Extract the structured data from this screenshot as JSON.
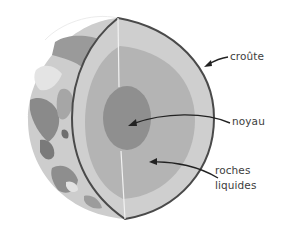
{
  "diagram": {
    "colors": {
      "background": "#ffffff",
      "surface_light": "#d8d8d8",
      "surface_dark": "#7e7e7e",
      "crust": "#cfcfcf",
      "mantle": "#b4b4b4",
      "core": "#8f8f8f",
      "outline": "#4a4a4a",
      "divider": "#f2f2f2",
      "text": "#3d3d3d"
    },
    "labels": [
      {
        "id": "crust",
        "text": "croûte"
      },
      {
        "id": "core",
        "text": "noyau"
      },
      {
        "id": "mantle",
        "line1": "roches",
        "line2": "liquides"
      }
    ]
  }
}
